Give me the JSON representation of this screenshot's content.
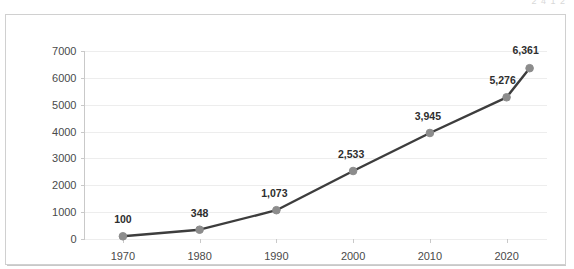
{
  "clipped_top_text": "2 4 1 2",
  "colors": {
    "line": "#3d3d3d",
    "marker": "#8c8c8c",
    "gridline": "#ededed",
    "axis": "#c9c9c9",
    "frame": "#d0d0d0",
    "label_text": "#2e2e2e",
    "tick_text": "#4a4a4a",
    "background": "#ffffff"
  },
  "chart_data": {
    "type": "line",
    "title": "",
    "subtitle": "",
    "xlabel": "",
    "ylabel": "",
    "x": [
      1970,
      1980,
      1990,
      2000,
      2010,
      2020,
      2023
    ],
    "values": [
      100,
      348,
      1073,
      2533,
      3945,
      5276,
      6361
    ],
    "point_labels": [
      "100",
      "348",
      "1,073",
      "2,533",
      "3,945",
      "5,276",
      "6,361"
    ],
    "x_tick_values": [
      1970,
      1980,
      1990,
      2000,
      2010,
      2020
    ],
    "x_tick_labels": [
      "1970",
      "1980",
      "1990",
      "2000",
      "2010",
      "2020"
    ],
    "y_tick_values": [
      0,
      1000,
      2000,
      3000,
      4000,
      5000,
      6000,
      7000
    ],
    "y_tick_labels": [
      "0",
      "1000",
      "2000",
      "3000",
      "4000",
      "5000",
      "6000",
      "7000"
    ],
    "xlim": [
      1965,
      2025
    ],
    "ylim": [
      0,
      7000
    ],
    "grid": true,
    "grid_axis": "y",
    "legend": false,
    "legend_position": "none",
    "markers": true,
    "marker_shape": "circle",
    "data_labels_shown": true
  },
  "axis_ticks": {
    "y": [
      {
        "label": "7000",
        "value": 7000
      },
      {
        "label": "6000",
        "value": 6000
      },
      {
        "label": "5000",
        "value": 5000
      },
      {
        "label": "4000",
        "value": 4000
      },
      {
        "label": "3000",
        "value": 3000
      },
      {
        "label": "2000",
        "value": 2000
      },
      {
        "label": "1000",
        "value": 1000
      },
      {
        "label": "0",
        "value": 0
      }
    ],
    "x": [
      {
        "label": "1970",
        "value": 1970
      },
      {
        "label": "1980",
        "value": 1980
      },
      {
        "label": "1990",
        "value": 1990
      },
      {
        "label": "2000",
        "value": 2000
      },
      {
        "label": "2010",
        "value": 2010
      },
      {
        "label": "2020",
        "value": 2020
      }
    ]
  },
  "points": [
    {
      "label": "100",
      "value": 100,
      "x": 1970
    },
    {
      "label": "348",
      "value": 348,
      "x": 1980
    },
    {
      "label": "1,073",
      "value": 1073,
      "x": 1990
    },
    {
      "label": "2,533",
      "value": 2533,
      "x": 2000
    },
    {
      "label": "3,945",
      "value": 3945,
      "x": 2010
    },
    {
      "label": "5,276",
      "value": 5276,
      "x": 2020
    },
    {
      "label": "6,361",
      "value": 6361,
      "x": 2023
    }
  ]
}
